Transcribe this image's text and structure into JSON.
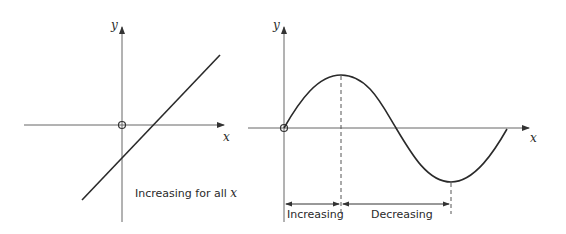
{
  "left_graph": {
    "y_axis_label": "y",
    "x_axis_label": "x",
    "annotation": "Increasing for all ",
    "annotation_var": "x",
    "description": "straight line with positive gradient"
  },
  "right_graph": {
    "y_axis_label": "y",
    "x_axis_label": "x",
    "interval_labels": [
      "Increasing",
      "Decreasing"
    ],
    "description": "sine-like curve starting at origin, rising to a maximum, falling to a minimum, then rising back to the x-axis"
  },
  "colors": {
    "axis": "#555555",
    "curve": "#2a2a2a"
  }
}
